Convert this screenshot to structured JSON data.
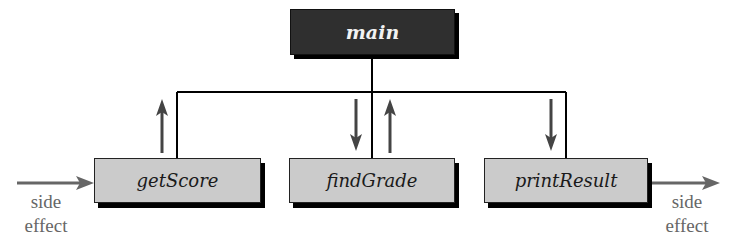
{
  "diagram": {
    "type": "structure-chart",
    "main": {
      "label": "main"
    },
    "modules": [
      {
        "label": "getScore"
      },
      {
        "label": "findGrade"
      },
      {
        "label": "printResult"
      }
    ],
    "side_effects": {
      "left": {
        "line1": "side",
        "line2": "effect"
      },
      "right": {
        "line1": "side",
        "line2": "effect"
      }
    },
    "colors": {
      "main_fill": "#2f2f2f",
      "module_fill": "#cbcbcb",
      "arrow": "#555555",
      "line": "#000000"
    }
  }
}
